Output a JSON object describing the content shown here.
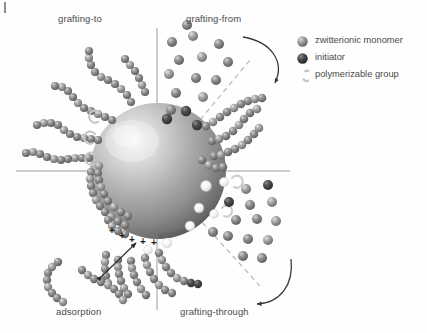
{
  "figure": {
    "type": "schematic-diagram",
    "background_color": "#fefefe",
    "center": {
      "x": 158,
      "y": 171
    },
    "particle": {
      "name": "nanoparticle-core",
      "cx": 158,
      "cy": 171,
      "r": 68,
      "highlight_color": "#f2f2f2",
      "mid_color": "#a8a8a8",
      "edge_color": "#6a6a6a",
      "highlight_offset": {
        "x": -26,
        "y": -30
      }
    },
    "axes": {
      "color": "#9a9a9a",
      "horizontal": {
        "x1": 16,
        "y1": 171,
        "x2": 290,
        "y2": 171
      },
      "vertical": {
        "x1": 157,
        "y1": 28,
        "x2": 157,
        "y2": 310
      },
      "diagonals_dashed": [
        {
          "x1": 158,
          "y1": 171,
          "x2": 248,
          "y2": 62
        },
        {
          "x1": 158,
          "y1": 171,
          "x2": 258,
          "y2": 284
        }
      ],
      "dash_color": "#b0b0b0"
    }
  },
  "quadrant_labels": [
    {
      "name": "label-grafting-to",
      "text": "grafting-to",
      "x": 58,
      "y": 14
    },
    {
      "name": "label-grafting-from",
      "text": "grafting-from",
      "x": 186,
      "y": 14
    },
    {
      "name": "label-adsorption",
      "text": "adsorption",
      "x": 56,
      "y": 310
    },
    {
      "name": "label-grafting-through",
      "text": "grafting-through",
      "x": 180,
      "y": 310
    }
  ],
  "legend": {
    "title": "",
    "items": [
      {
        "name": "legend-zwitterionic-monomer",
        "label": "zwitterionic monomer",
        "icon": "sphere-light-icon",
        "color": "#9b9b9b"
      },
      {
        "name": "legend-initiator",
        "label": "initiator",
        "icon": "sphere-dark-icon",
        "color": "#4d4d4d"
      },
      {
        "name": "legend-polymerizable-group",
        "label": "polymerizable group",
        "icon": "crescent-hook-icon",
        "color": "#c9c9c9"
      }
    ]
  },
  "annotations": {
    "charge_symbols": {
      "name": "positive-charge-marks",
      "glyph": "+",
      "count": 6,
      "color": "#1e1e1e",
      "positions": [
        {
          "x": 110,
          "y": 231
        },
        {
          "x": 120,
          "y": 236
        },
        {
          "x": 130,
          "y": 240
        },
        {
          "x": 141,
          "y": 242
        },
        {
          "x": 152,
          "y": 243
        },
        {
          "x": 163,
          "y": 242
        }
      ]
    },
    "adsorption_arrow": {
      "name": "adsorption-double-arrow",
      "x1": 102,
      "y1": 276,
      "x2": 136,
      "y2": 243,
      "color": "#2a2a2a",
      "double_headed": true
    },
    "curved_arrows": [
      {
        "name": "grafting-from-curved-arrow",
        "quadrant": "grafting-from",
        "color": "#3a3a3a"
      },
      {
        "name": "grafting-through-curved-arrow",
        "quadrant": "grafting-through",
        "color": "#3a3a3a"
      }
    ]
  },
  "colors": {
    "monomer_light": "#a0a0a0",
    "monomer_mid": "#8d8d8d",
    "initiator_dark": "#474747",
    "polymerizable_white": "#fbfbfb",
    "chain_gray": "#8a8a8a",
    "axis_gray": "#9a9a9a",
    "text_gray": "#4a4a4a"
  },
  "counts": {
    "grafting_to_chains": 5,
    "grafting_from_chains": 4,
    "grafting_through_chains": 5,
    "adsorption_free_chains": 2,
    "free_monomers_top_right": 13,
    "free_monomers_bottom_right": 14,
    "surface_initiators": 3,
    "surface_polymerizable_groups": 6,
    "surface_hooks_left": 3
  }
}
